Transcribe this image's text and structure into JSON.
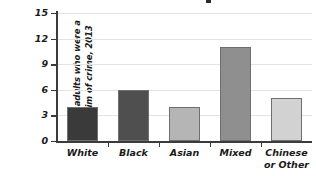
{
  "chart_data": {
    "type": "bar",
    "title": "",
    "xlabel": "",
    "ylabel": "% of adults who were a victim of crime, 2013",
    "ylabel_line1": "% of adults who were a",
    "ylabel_line2": "victim of crime, 2013",
    "categories": [
      "White",
      "Black",
      "Asian",
      "Mixed",
      "Chinese or Other"
    ],
    "category_lines": [
      [
        "White"
      ],
      [
        "Black"
      ],
      [
        "Asian"
      ],
      [
        "Mixed"
      ],
      [
        "Chinese",
        "or Other"
      ]
    ],
    "values": [
      4,
      6,
      4,
      11,
      5
    ],
    "bar_colors": [
      "#3a3a3a",
      "#4f4f4f",
      "#b5b5b5",
      "#8f8f8f",
      "#d2d2d2"
    ],
    "bar_edge_color": "#6f6f6f",
    "ylim": [
      0,
      15
    ],
    "yticks": [
      0,
      3,
      6,
      9,
      12,
      15
    ],
    "ytick_labels": [
      "0",
      "3",
      "6",
      "9",
      "12",
      "15"
    ],
    "grid": true,
    "grid_color": "#e3e3e3",
    "legend": "none",
    "axis_color": "#3b3b3b"
  }
}
